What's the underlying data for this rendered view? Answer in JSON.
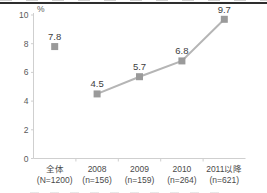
{
  "chart_data": {
    "type": "line",
    "title": "",
    "unit_label": "%",
    "categories": [
      "全体",
      "2008",
      "2009",
      "2010",
      "2011以降"
    ],
    "category_sublabels": [
      "(N=1200)",
      "(n=156)",
      "(n=159)",
      "(n=264)",
      "(n=621)"
    ],
    "values": [
      7.8,
      4.5,
      5.7,
      6.8,
      9.7
    ],
    "data_labels": [
      "7.8",
      "4.5",
      "5.7",
      "6.8",
      "9.7"
    ],
    "line_from_index": 1,
    "ylim": [
      0,
      10
    ],
    "yticks": [
      0,
      2,
      4,
      6,
      8,
      10
    ],
    "marker": "square",
    "grid": false,
    "legend": "none",
    "colors": {
      "marker": "#9a9a9a",
      "line": "#b5b5b5",
      "value_text": "#3d3d3d",
      "tick_text": "#5a5a5a",
      "category_text": "#4a4a4a",
      "axis": "#cfcfcf"
    }
  }
}
